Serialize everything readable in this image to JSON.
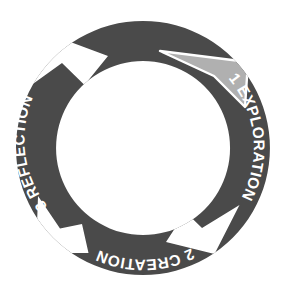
{
  "diagram": {
    "type": "cyclical-process-ring",
    "background_color": "#ffffff",
    "ring": {
      "center_x": 143,
      "center_y": 148,
      "outer_radius": 127,
      "inner_radius": 87,
      "fill_color": "#4a4a4a",
      "label_color": "#ffffff",
      "notch_color": "#ffffff",
      "highlight_color": "#b0b0b0"
    },
    "segments": [
      {
        "number": "1",
        "name": "EXPLORATION",
        "label": "1 EXPLORATION",
        "position": "right",
        "start_angle": -52,
        "end_angle": 52,
        "text_reading": "downward",
        "fill_color": "#4a4a4a"
      },
      {
        "number": "2",
        "name": "CREATION",
        "label": "2 CREATION",
        "position": "bottom",
        "start_angle": 52,
        "end_angle": 143,
        "text_reading": "inverted",
        "fill_color": "#4a4a4a"
      },
      {
        "number": "3",
        "name": "REFLECTION",
        "label": "3 REFLECTION",
        "position": "left",
        "start_angle": 143,
        "end_angle": 232,
        "text_reading": "upward",
        "fill_color": "#4a4a4a"
      },
      {
        "number": "4",
        "name": "IMPLEMENTATION",
        "label": "4 IMPLEMENTATION",
        "position": "top",
        "start_angle": 232,
        "end_angle": 308,
        "text_reading": "upright",
        "fill_color": "#4a4a4a"
      }
    ],
    "separators": [
      {
        "name": "separator-implementation-to-exploration",
        "position": "upper-right",
        "angle": -52,
        "style": "highlighted-chevron",
        "fill_color": "#b0b0b0"
      },
      {
        "name": "separator-exploration-to-creation",
        "position": "lower-right",
        "angle": 52,
        "style": "notch-chevron",
        "fill_color": "#ffffff"
      },
      {
        "name": "separator-creation-to-reflection",
        "position": "lower-left",
        "angle": 143,
        "style": "notch-chevron",
        "fill_color": "#ffffff"
      },
      {
        "name": "separator-reflection-to-implementation",
        "position": "upper-left",
        "angle": 232,
        "style": "notch-chevron",
        "fill_color": "#ffffff"
      }
    ]
  }
}
